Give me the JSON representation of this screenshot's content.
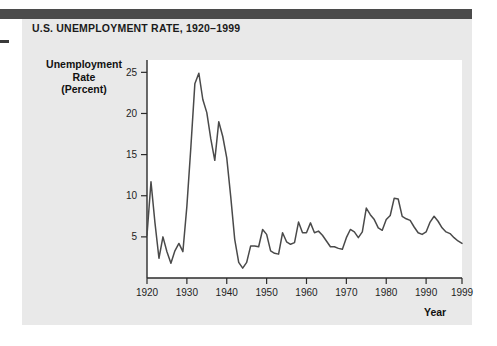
{
  "figure": {
    "title": "U.S. UNEMPLOYMENT RATE, 1920–1999",
    "panel_color": "#e9e9e9",
    "header_bar_color": "#4b4b4b",
    "line_color": "#4a4a4a",
    "plot_background": "#ffffff"
  },
  "chart_data": {
    "type": "line",
    "title": "U.S. UNEMPLOYMENT RATE, 1920–1999",
    "xlabel": "Year",
    "ylabel": "Unemployment Rate (Percent)",
    "ylabel_lines": [
      "Unemployment",
      "Rate",
      "(Percent)"
    ],
    "xlim": [
      1920,
      1999
    ],
    "ylim": [
      0,
      26.5
    ],
    "grid": false,
    "legend": null,
    "y_ticks": [
      5,
      10,
      15,
      20,
      25
    ],
    "y_tick_labels": [
      "5",
      "10",
      "15",
      "20",
      "25"
    ],
    "x_ticks": [
      1920,
      1930,
      1940,
      1950,
      1960,
      1970,
      1980,
      1990,
      1999
    ],
    "x_tick_labels": [
      "1920",
      "1930",
      "1940",
      "1950",
      "1960",
      "1970",
      "1980",
      "1990",
      "1999"
    ],
    "series": [
      {
        "name": "U.S. Unemployment Rate",
        "x": [
          1920,
          1921,
          1922,
          1923,
          1924,
          1925,
          1926,
          1927,
          1928,
          1929,
          1930,
          1931,
          1932,
          1933,
          1934,
          1935,
          1936,
          1937,
          1938,
          1939,
          1940,
          1941,
          1942,
          1943,
          1944,
          1945,
          1946,
          1947,
          1948,
          1949,
          1950,
          1951,
          1952,
          1953,
          1954,
          1955,
          1956,
          1957,
          1958,
          1959,
          1960,
          1961,
          1962,
          1963,
          1964,
          1965,
          1966,
          1967,
          1968,
          1969,
          1970,
          1971,
          1972,
          1973,
          1974,
          1975,
          1976,
          1977,
          1978,
          1979,
          1980,
          1981,
          1982,
          1983,
          1984,
          1985,
          1986,
          1987,
          1988,
          1989,
          1990,
          1991,
          1992,
          1993,
          1994,
          1995,
          1996,
          1997,
          1998,
          1999
        ],
        "values": [
          5.2,
          11.7,
          6.7,
          2.4,
          5.0,
          3.2,
          1.8,
          3.3,
          4.2,
          3.2,
          8.7,
          15.9,
          23.6,
          24.9,
          21.7,
          20.1,
          16.9,
          14.3,
          19.0,
          17.2,
          14.6,
          9.9,
          4.7,
          1.9,
          1.2,
          1.9,
          3.9,
          3.9,
          3.8,
          5.9,
          5.3,
          3.3,
          3.0,
          2.9,
          5.5,
          4.4,
          4.1,
          4.3,
          6.8,
          5.5,
          5.5,
          6.7,
          5.5,
          5.7,
          5.2,
          4.5,
          3.8,
          3.8,
          3.6,
          3.5,
          4.9,
          5.9,
          5.6,
          4.9,
          5.6,
          8.5,
          7.7,
          7.1,
          6.1,
          5.8,
          7.1,
          7.6,
          9.7,
          9.6,
          7.5,
          7.2,
          7.0,
          6.2,
          5.5,
          5.3,
          5.6,
          6.8,
          7.5,
          6.9,
          6.1,
          5.6,
          5.4,
          4.9,
          4.5,
          4.2
        ]
      }
    ]
  }
}
